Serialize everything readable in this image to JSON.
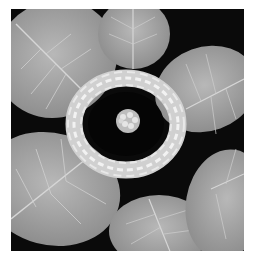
{
  "image": {
    "description": "Black-and-white photograph of seven large veined leaves arranged in a ring around a woven white wicker wreath, with a small cluster of white berries/buds in the center, on a black background",
    "colors": {
      "background": "#0a0a0a",
      "leaf": "#9a9a9a",
      "leaf_light": "#b5b5b5",
      "vein": "#d8d8d8",
      "wreath": "#e6e6e6",
      "margin": "#ffffff"
    },
    "leaves": [
      {
        "position": "top-left"
      },
      {
        "position": "top-center"
      },
      {
        "position": "top-right"
      },
      {
        "position": "middle-left"
      },
      {
        "position": "bottom-center"
      },
      {
        "position": "bottom-right"
      },
      {
        "position": "right"
      }
    ],
    "center_object": "woven wicker wreath",
    "center_detail": "cluster of small white buds"
  }
}
